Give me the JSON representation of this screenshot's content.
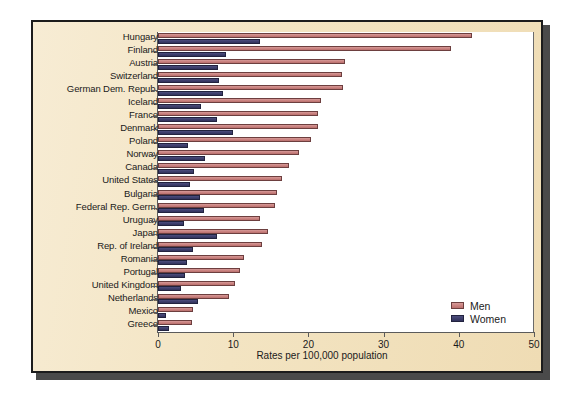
{
  "chart_data": {
    "type": "bar",
    "orientation": "horizontal",
    "title": "",
    "xlabel": "Rates per 100,000 population",
    "ylabel": "",
    "xlim": [
      0,
      50
    ],
    "xticks": [
      0,
      10,
      20,
      30,
      40,
      50
    ],
    "xtick_labels": [
      "0",
      "10",
      "20",
      "30",
      "40",
      "50"
    ],
    "grid": false,
    "legend_position": "bottom-right",
    "categories": [
      "Hungary",
      "Finland",
      "Austria",
      "Switzerland",
      "German Dem. Repub.",
      "Iceland",
      "France",
      "Denmark",
      "Poland",
      "Norway",
      "Canada",
      "United States",
      "Bulgaria",
      "Federal Rep. Germ.",
      "Uruguay",
      "Japan",
      "Rep. of Ireland",
      "Romania",
      "Portugal",
      "United Kingdom",
      "Netherlands",
      "Mexico",
      "Greece"
    ],
    "series": [
      {
        "name": "Men",
        "color": "#c9817f",
        "values": [
          41.8,
          39.0,
          24.9,
          24.5,
          24.6,
          21.7,
          21.3,
          21.3,
          20.4,
          18.7,
          17.4,
          16.5,
          15.8,
          15.6,
          13.6,
          14.6,
          13.8,
          11.5,
          10.9,
          10.3,
          9.4,
          4.7,
          4.5
        ]
      },
      {
        "name": "Women",
        "color": "#3d3e6b",
        "values": [
          13.6,
          9.0,
          8.0,
          8.1,
          8.6,
          5.7,
          7.8,
          10.0,
          4.0,
          6.3,
          4.8,
          4.2,
          5.6,
          6.1,
          3.5,
          7.9,
          4.7,
          3.8,
          3.6,
          3.0,
          5.3,
          1.0,
          1.5
        ]
      }
    ]
  },
  "legend": {
    "items": [
      {
        "label": "Men"
      },
      {
        "label": "Women"
      }
    ]
  },
  "colors": {
    "men": "#c9817f",
    "women": "#3d3e6b",
    "background": "#f3e4c2",
    "plot_background": "#ffffff",
    "frame": "#1c1c1c"
  }
}
